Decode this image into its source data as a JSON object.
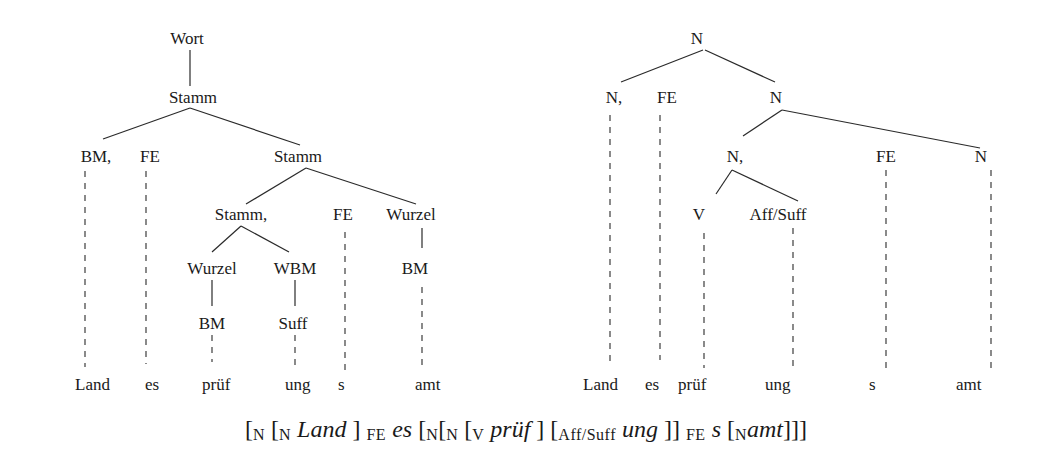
{
  "left_tree": {
    "nodes": [
      {
        "id": "wort",
        "label": "Wort",
        "x": 187,
        "y": 44
      },
      {
        "id": "stamm1",
        "label": "Stamm",
        "x": 193,
        "y": 103
      },
      {
        "id": "bm1",
        "label": "BM,",
        "x": 96,
        "y": 162
      },
      {
        "id": "fe1",
        "label": "FE",
        "x": 150,
        "y": 162
      },
      {
        "id": "stamm2",
        "label": "Stamm",
        "x": 298,
        "y": 162
      },
      {
        "id": "stamm3",
        "label": "Stamm,",
        "x": 241,
        "y": 220
      },
      {
        "id": "fe2",
        "label": "FE",
        "x": 343,
        "y": 220
      },
      {
        "id": "wurzel1",
        "label": "Wurzel",
        "x": 411,
        "y": 220
      },
      {
        "id": "wurzel2",
        "label": "Wurzel",
        "x": 212,
        "y": 274
      },
      {
        "id": "wbm",
        "label": "WBM",
        "x": 295,
        "y": 274
      },
      {
        "id": "bm2",
        "label": "BM",
        "x": 415,
        "y": 274
      },
      {
        "id": "bm3",
        "label": "BM",
        "x": 212,
        "y": 329
      },
      {
        "id": "suff",
        "label": "Suff",
        "x": 293,
        "y": 329
      }
    ],
    "solid_edges": [
      [
        190,
        50,
        190,
        86
      ],
      [
        190,
        108,
        103,
        139
      ],
      [
        190,
        108,
        300,
        145
      ],
      [
        306,
        168,
        246,
        204
      ],
      [
        306,
        168,
        416,
        204
      ],
      [
        241,
        226,
        212,
        252
      ],
      [
        241,
        226,
        289,
        252
      ],
      [
        422,
        228,
        422,
        248
      ],
      [
        212,
        280,
        212,
        306
      ],
      [
        295,
        280,
        295,
        306
      ]
    ],
    "dashed_edges": [
      [
        85,
        171,
        85,
        367
      ],
      [
        146,
        171,
        146,
        364
      ],
      [
        212,
        335,
        212,
        362
      ],
      [
        295,
        335,
        295,
        370
      ],
      [
        345,
        232,
        345,
        370
      ],
      [
        422,
        287,
        422,
        366
      ]
    ],
    "leaves": [
      {
        "label": "Land",
        "x": 75,
        "y": 390
      },
      {
        "label": "es",
        "x": 145,
        "y": 390
      },
      {
        "label": "prüf",
        "x": 202,
        "y": 390
      },
      {
        "label": "ung",
        "x": 285,
        "y": 390
      },
      {
        "label": "s",
        "x": 338,
        "y": 390
      },
      {
        "label": "amt",
        "x": 415,
        "y": 390
      }
    ]
  },
  "right_tree": {
    "nodes": [
      {
        "id": "n_root",
        "label": "N",
        "x": 697,
        "y": 44
      },
      {
        "id": "n1",
        "label": "N,",
        "x": 614,
        "y": 103
      },
      {
        "id": "fe1",
        "label": "FE",
        "x": 667,
        "y": 103
      },
      {
        "id": "n2",
        "label": "N",
        "x": 776,
        "y": 103
      },
      {
        "id": "n3",
        "label": "N,",
        "x": 735,
        "y": 162
      },
      {
        "id": "fe2",
        "label": "FE",
        "x": 886,
        "y": 162
      },
      {
        "id": "n4",
        "label": "N",
        "x": 981,
        "y": 162
      },
      {
        "id": "v",
        "label": "V",
        "x": 699,
        "y": 220
      },
      {
        "id": "affsuff",
        "label": "Aff/Suff",
        "x": 778,
        "y": 220
      }
    ],
    "solid_edges": [
      [
        703,
        50,
        621,
        82
      ],
      [
        705,
        50,
        775,
        82
      ],
      [
        782,
        110,
        743,
        136
      ],
      [
        782,
        110,
        980,
        148
      ],
      [
        732,
        170,
        716,
        194
      ],
      [
        732,
        170,
        798,
        201
      ]
    ],
    "dashed_edges": [
      [
        610,
        115,
        610,
        366
      ],
      [
        660,
        115,
        660,
        360
      ],
      [
        704,
        233,
        704,
        368
      ],
      [
        793,
        228,
        793,
        366
      ],
      [
        886,
        170,
        886,
        374
      ],
      [
        991,
        170,
        991,
        374
      ]
    ],
    "leaves": [
      {
        "label": "Land",
        "x": 583,
        "y": 390
      },
      {
        "label": "es",
        "x": 645,
        "y": 390
      },
      {
        "label": "prüf",
        "x": 678,
        "y": 390
      },
      {
        "label": "ung",
        "x": 765,
        "y": 390
      },
      {
        "label": "s",
        "x": 869,
        "y": 390
      },
      {
        "label": "amt",
        "x": 956,
        "y": 390
      }
    ]
  },
  "formula": {
    "segments": [
      {
        "text": "[",
        "style": "plain"
      },
      {
        "text": "N",
        "style": "sub"
      },
      {
        "text": " [",
        "style": "plain"
      },
      {
        "text": "N",
        "style": "sub"
      },
      {
        "text": " Land",
        "style": "italic"
      },
      {
        "text": " ] ",
        "style": "plain"
      },
      {
        "text": "FE",
        "style": "sub"
      },
      {
        "text": " es",
        "style": "italic"
      },
      {
        "text": " [",
        "style": "plain"
      },
      {
        "text": "N",
        "style": "sub"
      },
      {
        "text": "[",
        "style": "plain"
      },
      {
        "text": "N",
        "style": "sub"
      },
      {
        "text": " [",
        "style": "plain"
      },
      {
        "text": "V",
        "style": "sub"
      },
      {
        "text": " prüf",
        "style": "italic"
      },
      {
        "text": " ] [",
        "style": "plain"
      },
      {
        "text": "Aff/Suff",
        "style": "sub"
      },
      {
        "text": " ung",
        "style": "italic"
      },
      {
        "text": " ]] ",
        "style": "plain"
      },
      {
        "text": "FE",
        "style": "sub"
      },
      {
        "text": " s",
        "style": "italic"
      },
      {
        "text": " [",
        "style": "plain"
      },
      {
        "text": "N",
        "style": "sub"
      },
      {
        "text": "amt",
        "style": "italic"
      },
      {
        "text": "]]]",
        "style": "plain"
      }
    ]
  }
}
